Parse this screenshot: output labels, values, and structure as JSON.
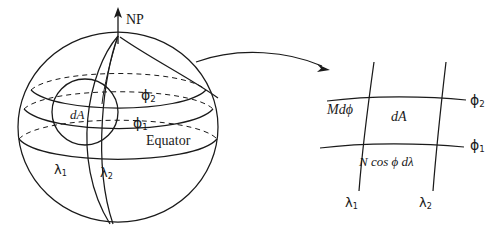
{
  "figure": {
    "background_color": "#ffffff",
    "ink_color": "#1a1a1a"
  },
  "sphere_panel": {
    "axis_label": "NP",
    "parallel_upper_label": "ϕ",
    "parallel_upper_sub": "2",
    "parallel_lower_label": "ϕ",
    "parallel_lower_sub": "1",
    "equator_label": "Equator",
    "area_element_label": "dA",
    "meridian_left_label": "λ",
    "meridian_left_sub": "1",
    "meridian_right_label": "λ",
    "meridian_right_sub": "2"
  },
  "detail_panel": {
    "side_vertical_label": "Mdϕ",
    "side_horizontal_label": "N cos ϕ dλ",
    "area_element_label": "dA",
    "parallel_upper_label": "ϕ",
    "parallel_upper_sub": "2",
    "parallel_lower_label": "ϕ",
    "parallel_lower_sub": "1",
    "meridian_left_label": "λ",
    "meridian_left_sub": "1",
    "meridian_right_label": "λ",
    "meridian_right_sub": "2"
  }
}
